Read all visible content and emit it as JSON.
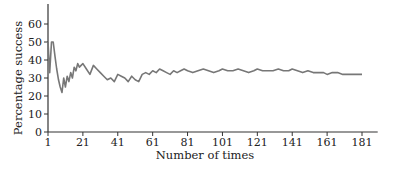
{
  "chart_data": {
    "type": "line",
    "title": "",
    "xlabel": "Number of times",
    "ylabel": "Percentage success",
    "xlim": [
      1,
      190
    ],
    "ylim": [
      0,
      70
    ],
    "x_ticks": [
      1,
      21,
      41,
      61,
      81,
      101,
      121,
      141,
      161,
      181
    ],
    "y_ticks": [
      0,
      10,
      20,
      30,
      40,
      50,
      60
    ],
    "grid": false,
    "legend": null,
    "line_color": "#777777",
    "axis_color": "#333333",
    "series": [
      {
        "name": "Percentage success",
        "x": [
          1,
          2,
          3,
          4,
          5,
          6,
          7,
          8,
          9,
          10,
          11,
          12,
          13,
          14,
          15,
          16,
          17,
          18,
          19,
          20,
          21,
          23,
          25,
          27,
          29,
          31,
          33,
          35,
          37,
          39,
          41,
          43,
          45,
          47,
          49,
          51,
          53,
          55,
          57,
          59,
          61,
          63,
          65,
          67,
          69,
          71,
          73,
          75,
          77,
          79,
          81,
          84,
          87,
          90,
          93,
          96,
          99,
          101,
          104,
          107,
          110,
          113,
          116,
          119,
          121,
          124,
          127,
          130,
          133,
          136,
          139,
          141,
          144,
          147,
          150,
          153,
          156,
          159,
          161,
          164,
          167,
          170,
          173,
          176,
          179,
          181
        ],
        "y": [
          50,
          33,
          50,
          50,
          42,
          35,
          29,
          25,
          22,
          30,
          25,
          31,
          28,
          33,
          30,
          36,
          34,
          38,
          36,
          37,
          38,
          35,
          32,
          37,
          35,
          33,
          31,
          29,
          30,
          28,
          32,
          31,
          30,
          28,
          31,
          29,
          28,
          32,
          33,
          32,
          34,
          33,
          35,
          34,
          33,
          32,
          34,
          33,
          34,
          35,
          34,
          33,
          34,
          35,
          34,
          33,
          34,
          35,
          34,
          34,
          35,
          34,
          33,
          34,
          35,
          34,
          34,
          34,
          35,
          34,
          34,
          35,
          34,
          33,
          34,
          33,
          33,
          33,
          32,
          33,
          33,
          32,
          32,
          32,
          32,
          32
        ]
      }
    ]
  }
}
